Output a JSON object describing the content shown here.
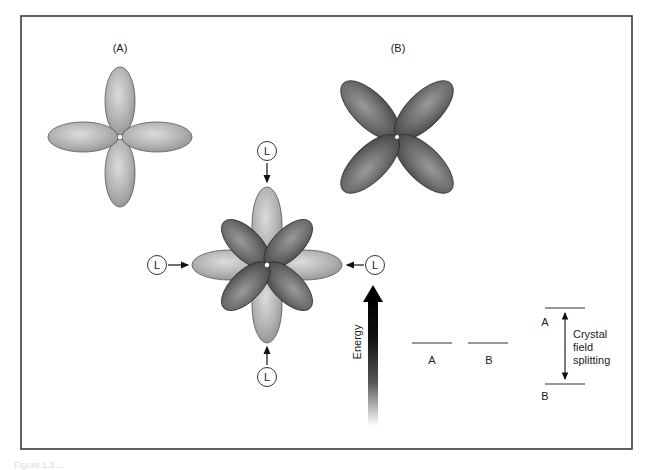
{
  "figure": {
    "panel_a_label": "(A)",
    "panel_b_label": "(B)",
    "ligand_label": "L",
    "energy_axis_label": "Energy",
    "levels_unsplit": {
      "a_label": "A",
      "b_label": "B"
    },
    "levels_split": {
      "upper_label": "A",
      "lower_label": "B",
      "annotation_line1": "Crystal",
      "annotation_line2": "field",
      "annotation_line3": "splitting"
    },
    "caption": "Figure 1.3 ..."
  },
  "colors": {
    "frame": "#3a3a3a",
    "light_lobe": "#b4b4b4",
    "light_lobe_edge": "#555555",
    "dark_lobe": "#6e6e6e",
    "dark_lobe_edge": "#2e2e2e",
    "arrow": "#111111"
  }
}
